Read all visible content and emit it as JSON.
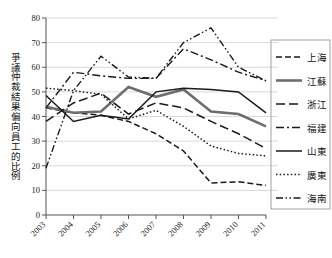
{
  "chart_data": {
    "type": "line",
    "title": "",
    "xlabel": "",
    "ylabel": "爭議仲裁結果偏向員工的比例",
    "x": [
      2003,
      2004,
      2005,
      2006,
      2007,
      2008,
      2009,
      2010,
      2011
    ],
    "xtick_labels": [
      "2003",
      "2004",
      "2005",
      "2006",
      "2007",
      "2008",
      "2009",
      "2010",
      "2011"
    ],
    "ylim": [
      0,
      80
    ],
    "ytick_labels": [
      "0",
      "10",
      "20",
      "30",
      "40",
      "50",
      "60",
      "70",
      "80"
    ],
    "yticks": [
      0,
      10,
      20,
      30,
      40,
      50,
      60,
      70,
      80
    ],
    "grid": true,
    "legend_position": "right",
    "series": [
      {
        "name": "上海",
        "values": [
          43.5,
          41.5,
          40.5,
          38.0,
          33.0,
          26.0,
          13.0,
          13.5,
          12.0
        ],
        "style": "dashed",
        "color": "#1a1a1a",
        "width": 1.5,
        "dasharray": "6,3"
      },
      {
        "name": "江蘇",
        "values": [
          44.0,
          41.5,
          42.0,
          52.0,
          48.0,
          51.0,
          42.0,
          41.0,
          36.0
        ],
        "style": "solid-thick",
        "color": "#6e6e6e",
        "width": 2.6,
        "dasharray": "none"
      },
      {
        "name": "浙江",
        "values": [
          38.0,
          45.5,
          49.5,
          41.0,
          45.5,
          43.5,
          38.0,
          33.0,
          27.0
        ],
        "style": "long-dash",
        "color": "#1a1a1a",
        "width": 1.5,
        "dasharray": "9,4"
      },
      {
        "name": "福建",
        "values": [
          43.5,
          58.0,
          56.5,
          55.5,
          55.5,
          67.5,
          63.0,
          58.0,
          54.5
        ],
        "style": "dash-dot",
        "color": "#1a1a1a",
        "width": 1.4,
        "dasharray": "8,3,2,3"
      },
      {
        "name": "山東",
        "values": [
          48.5,
          38.0,
          40.5,
          39.0,
          50.0,
          51.5,
          51.0,
          50.0,
          41.5
        ],
        "style": "solid",
        "color": "#1a1a1a",
        "width": 1.5,
        "dasharray": "none"
      },
      {
        "name": "廣東",
        "values": [
          51.5,
          50.5,
          49.0,
          39.0,
          42.5,
          36.0,
          28.0,
          25.0,
          24.0
        ],
        "style": "dotted",
        "color": "#1a1a1a",
        "width": 1.5,
        "dasharray": "1.5,2.2"
      },
      {
        "name": "海南",
        "values": [
          19.0,
          50.5,
          64.5,
          56.0,
          55.5,
          70.0,
          76.0,
          60.0,
          54.5
        ],
        "style": "dash-dot-dot",
        "color": "#1a1a1a",
        "width": 1.4,
        "dasharray": "7,2.5,1.5,2.5,1.5,2.5"
      }
    ]
  },
  "legend": {
    "items": [
      {
        "label": "上海"
      },
      {
        "label": "江蘇"
      },
      {
        "label": "浙江"
      },
      {
        "label": "福建"
      },
      {
        "label": "山東"
      },
      {
        "label": "廣東"
      },
      {
        "label": "海南"
      }
    ]
  }
}
